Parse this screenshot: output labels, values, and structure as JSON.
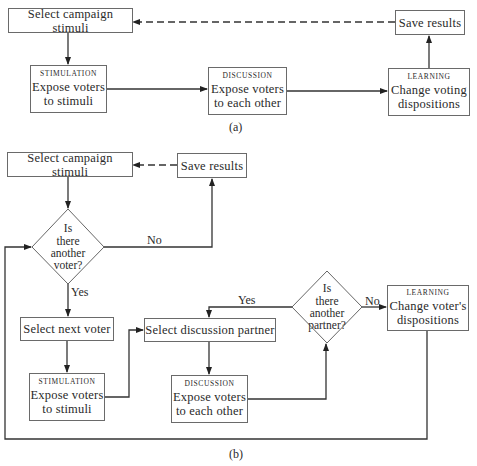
{
  "diagram_a": {
    "caption": "(a)",
    "nodes": {
      "select_stimuli": {
        "label": "Select campaign stimuli"
      },
      "stimulation": {
        "caption": "STIMULATION",
        "label_line1": "Expose voters",
        "label_line2": "to stimuli"
      },
      "discussion": {
        "caption": "DISCUSSION",
        "label_line1": "Expose voters",
        "label_line2": "to each other"
      },
      "learning": {
        "caption": "LEARNING",
        "label_line1": "Change voting",
        "label_line2": "dispositions"
      },
      "save_results": {
        "label": "Save results"
      }
    },
    "edges": [
      {
        "from": "select_stimuli",
        "to": "stimulation",
        "style": "solid"
      },
      {
        "from": "stimulation",
        "to": "discussion",
        "style": "solid"
      },
      {
        "from": "discussion",
        "to": "learning",
        "style": "solid"
      },
      {
        "from": "learning",
        "to": "save_results",
        "style": "solid"
      },
      {
        "from": "save_results",
        "to": "select_stimuli",
        "style": "dashed"
      }
    ]
  },
  "diagram_b": {
    "caption": "(b)",
    "nodes": {
      "select_stimuli": {
        "label": "Select campaign stimuli"
      },
      "save_results": {
        "label": "Save results"
      },
      "voter_decision": {
        "line1": "Is",
        "line2": "there",
        "line3": "another",
        "line4": "voter?"
      },
      "select_next_voter": {
        "label": "Select next voter"
      },
      "stimulation": {
        "caption": "STIMULATION",
        "label_line1": "Expose voters",
        "label_line2": "to stimuli"
      },
      "select_partner": {
        "label": "Select discussion partner"
      },
      "discussion": {
        "caption": "DISCUSSION",
        "label_line1": "Expose voters",
        "label_line2": "to each other"
      },
      "partner_decision": {
        "line1": "Is",
        "line2": "there",
        "line3": "another",
        "line4": "partner?"
      },
      "learning": {
        "caption": "LEARNING",
        "label_line1": "Change voter's",
        "label_line2": "dispositions"
      }
    },
    "edge_labels": {
      "voter_no": "No",
      "voter_yes": "Yes",
      "partner_yes": "Yes",
      "partner_no": "No"
    },
    "edges": [
      {
        "from": "select_stimuli",
        "to": "voter_decision",
        "style": "solid"
      },
      {
        "from": "voter_decision",
        "to": "save_results",
        "label": "No",
        "style": "solid"
      },
      {
        "from": "save_results",
        "to": "select_stimuli",
        "style": "dashed"
      },
      {
        "from": "voter_decision",
        "to": "select_next_voter",
        "label": "Yes",
        "style": "solid"
      },
      {
        "from": "select_next_voter",
        "to": "stimulation",
        "style": "solid"
      },
      {
        "from": "stimulation",
        "to": "select_partner",
        "style": "solid"
      },
      {
        "from": "select_partner",
        "to": "discussion",
        "style": "solid"
      },
      {
        "from": "discussion",
        "to": "partner_decision",
        "style": "solid"
      },
      {
        "from": "partner_decision",
        "to": "select_partner",
        "label": "Yes",
        "style": "solid"
      },
      {
        "from": "partner_decision",
        "to": "learning",
        "label": "No",
        "style": "solid"
      },
      {
        "from": "learning",
        "to": "voter_decision",
        "style": "solid"
      }
    ]
  },
  "colors": {
    "line": "#333333",
    "box_border": "#6a6a6a",
    "text": "#2a2a2a",
    "background": "#ffffff"
  }
}
